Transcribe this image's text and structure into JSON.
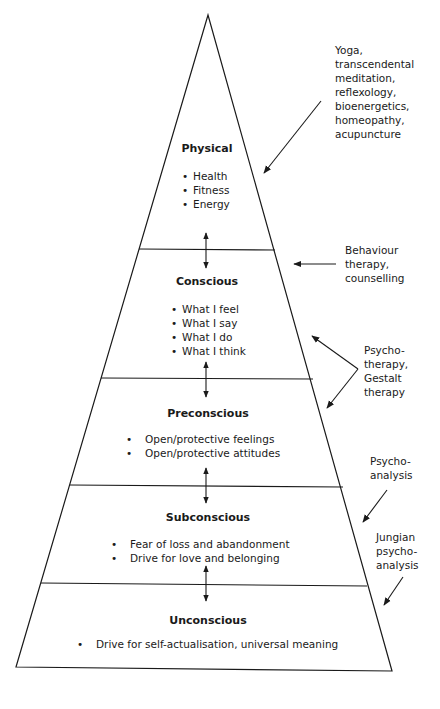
{
  "diagram": {
    "type": "pyramid",
    "stroke_color": "#1a1a1a",
    "levels": [
      {
        "title": "Physical",
        "items": [
          "Health",
          "Fitness",
          "Energy"
        ]
      },
      {
        "title": "Conscious",
        "items": [
          "What I feel",
          "What I say",
          "What I do",
          "What I think"
        ]
      },
      {
        "title": "Preconscious",
        "items": [
          "Open/protective feelings",
          "Open/protective attitudes"
        ]
      },
      {
        "title": "Subconscious",
        "items": [
          "Fear of loss and abandonment",
          "Drive for love and belonging"
        ]
      },
      {
        "title": "Unconscious",
        "items": [
          "Drive for self-actualisation, universal meaning"
        ]
      }
    ],
    "annotations": [
      {
        "text": "Yoga,\ntranscendental\nmeditation,\nreflexology,\nbioenergetics,\nhomeopathy,\nacupuncture",
        "targets": "Physical"
      },
      {
        "text": "Behaviour\ntherapy,\ncounselling",
        "targets": "Conscious"
      },
      {
        "text": "Psycho-\ntherapy,\nGestalt\ntherapy",
        "targets": "Conscious / Preconscious"
      },
      {
        "text": "Psycho-\nanalysis",
        "targets": "Subconscious"
      },
      {
        "text": "Jungian\npsycho-\nanalysis",
        "targets": "Unconscious"
      }
    ]
  }
}
